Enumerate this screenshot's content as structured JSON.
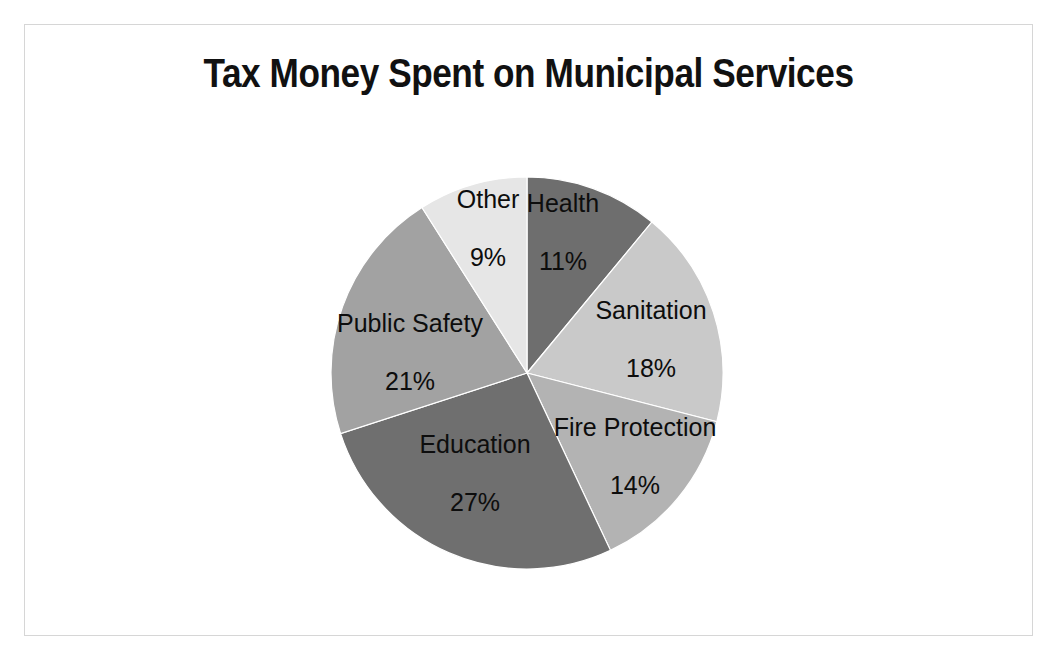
{
  "chart_data": {
    "type": "pie",
    "title": "Tax Money Spent on Municipal Services",
    "xlabel": "",
    "ylabel": "",
    "legend": "none",
    "grid": false,
    "units": "percent",
    "total": 100,
    "start_angle_deg": 0,
    "direction": "clockwise",
    "categories": [
      "Health",
      "Sanitation",
      "Fire Protection",
      "Education",
      "Public Safety",
      "Other"
    ],
    "values": [
      11,
      18,
      14,
      27,
      21,
      9
    ],
    "value_labels": [
      "11%",
      "18%",
      "14%",
      "27%",
      "21%",
      "9%"
    ],
    "colors": [
      "#6e6e6e",
      "#c9c9c9",
      "#b3b3b3",
      "#6f6f6f",
      "#a2a2a2",
      "#e6e6e6"
    ],
    "slices": [
      {
        "name": "Health",
        "value": 11,
        "value_label": "11%",
        "color": "#6e6e6e",
        "label_text": "Health\n11%",
        "label_x": 562,
        "label_y": 231,
        "start_deg": 0,
        "end_deg": 39.6
      },
      {
        "name": "Sanitation",
        "value": 18,
        "value_label": "18%",
        "color": "#c9c9c9",
        "label_text": "Sanitation\n18%",
        "label_x": 650,
        "label_y": 338,
        "start_deg": 39.6,
        "end_deg": 104.4
      },
      {
        "name": "Fire Protection",
        "value": 14,
        "value_label": "14%",
        "color": "#b3b3b3",
        "label_text": "Fire\nProtection\n14%",
        "label_x": 634,
        "label_y": 455,
        "start_deg": 104.4,
        "end_deg": 154.8
      },
      {
        "name": "Education",
        "value": 27,
        "value_label": "27%",
        "color": "#6f6f6f",
        "label_text": "Education\n27%",
        "label_x": 474,
        "label_y": 472,
        "start_deg": 154.8,
        "end_deg": 252.0
      },
      {
        "name": "Public Safety",
        "value": 21,
        "value_label": "21%",
        "color": "#a2a2a2",
        "label_text": "Public Safety\n21%",
        "label_x": 409,
        "label_y": 351,
        "start_deg": 252.0,
        "end_deg": 327.6
      },
      {
        "name": "Other",
        "value": 9,
        "value_label": "9%",
        "color": "#e6e6e6",
        "label_text": "Other\n9%",
        "label_x": 487,
        "label_y": 227,
        "start_deg": 327.6,
        "end_deg": 360.0
      }
    ],
    "geometry": {
      "center_x": 526,
      "center_y": 372,
      "radius": 196
    }
  },
  "figure": {
    "border_color": "#d6d6d6",
    "background": "#ffffff",
    "title_color": "#111111"
  }
}
